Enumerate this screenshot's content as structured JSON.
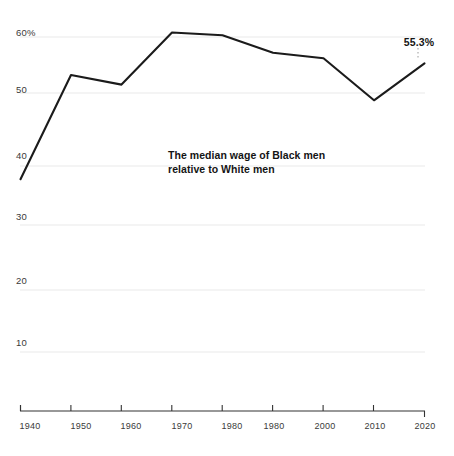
{
  "chart_data": {
    "type": "line",
    "title": "",
    "subtitle": "",
    "xlabel": "",
    "ylabel": "",
    "xlim": [
      1940,
      2020
    ],
    "ylim": [
      0,
      62
    ],
    "grid": true,
    "legend_position": "none",
    "x": [
      1940,
      1950,
      1960,
      1970,
      1980,
      1990,
      2000,
      2010,
      2020
    ],
    "x_tick_labels": [
      "1940",
      "1950",
      "1960",
      "1970",
      "1980",
      "1980",
      "2000",
      "2010",
      "2020"
    ],
    "y_tick_values": [
      60,
      50,
      40,
      30,
      20,
      10
    ],
    "y_tick_labels": [
      "60%",
      "50",
      "40",
      "30",
      "20",
      "10"
    ],
    "series": [
      {
        "name": "The median wage of Black men relative to White men",
        "color": "#1b1b1b",
        "values": [
          34.6,
          53.2,
          51.5,
          60.8,
          60.3,
          57.2,
          56.2,
          48.7,
          55.3
        ]
      }
    ],
    "annotations": [
      {
        "name": "series-annotation",
        "line1": "The median wage of Black men",
        "line2": "relative to White men"
      },
      {
        "name": "end-value-callout",
        "text": "55.3%",
        "x": 2020,
        "y": 55.3
      }
    ]
  },
  "axis": {
    "x_axis_color": "#333333",
    "gridline_color": "#e8e8e8"
  }
}
